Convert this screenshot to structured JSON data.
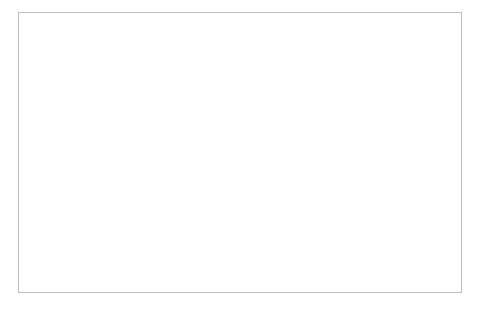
{
  "chart_data": {
    "type": "line",
    "title": "",
    "xlabel": "Number of Requests",
    "ylabel": "Execution Time (sec)",
    "xlim": [
      0,
      50
    ],
    "ylim": [
      0,
      3.5
    ],
    "ytick_values": [
      0,
      0.5,
      1,
      1.5,
      2,
      2.5,
      3,
      3.5
    ],
    "ytick_labels": [
      "0",
      "0.5",
      "1",
      "1.5",
      "2",
      "2.5",
      "3",
      "3.5"
    ],
    "xtick_values": [
      0,
      10,
      20,
      30,
      40,
      50
    ],
    "xtick_labels": [
      "0",
      "10",
      "20",
      "30",
      "40",
      "50"
    ],
    "grid": "horizontal",
    "legend_position": "bottom",
    "x": [
      1,
      2,
      3,
      4,
      5,
      6,
      7,
      8,
      9,
      10,
      11,
      12,
      13,
      14,
      15,
      16,
      17,
      18,
      19,
      20,
      21,
      22,
      23,
      24,
      25,
      26,
      27,
      28,
      29,
      30,
      31,
      32,
      33,
      34,
      35,
      36,
      37,
      38,
      39,
      40,
      41,
      42,
      43,
      44,
      45,
      46,
      47,
      48,
      49,
      50
    ],
    "series": [
      {
        "name": "Best Case",
        "color": "#a6a6a6",
        "width": 2.0,
        "values": [
          0.68,
          0.62,
          0.42,
          0.3,
          0.26,
          0.24,
          0.2,
          0.32,
          0.42,
          0.36,
          0.3,
          0.24,
          0.3,
          0.4,
          0.36,
          0.29,
          0.34,
          0.27,
          0.24,
          0.33,
          0.3,
          0.24,
          0.31,
          0.38,
          0.32,
          0.27,
          0.34,
          0.41,
          0.36,
          0.28,
          0.22,
          0.27,
          0.38,
          0.33,
          0.25,
          0.31,
          0.4,
          0.35,
          0.27,
          0.22,
          0.27,
          0.36,
          0.3,
          0.24,
          0.3,
          0.36,
          0.28,
          0.23,
          0.22,
          0.22
        ]
      },
      {
        "name": "Reactive Case",
        "color": "#2b2b2b",
        "width": 2.2,
        "values": [
          0.7,
          3.3,
          0.58,
          0.5,
          0.62,
          0.58,
          0.47,
          0.52,
          0.64,
          0.62,
          0.6,
          0.66,
          0.72,
          0.66,
          0.6,
          0.68,
          0.62,
          0.58,
          0.7,
          0.62,
          0.56,
          0.6,
          0.66,
          0.62,
          0.56,
          0.62,
          0.68,
          0.64,
          0.6,
          0.66,
          0.7,
          0.64,
          0.58,
          0.62,
          0.68,
          0.63,
          0.58,
          0.62,
          0.66,
          0.6,
          0.56,
          0.62,
          0.67,
          0.62,
          0.55,
          0.5,
          0.56,
          0.66,
          0.58,
          0.6
        ]
      },
      {
        "name": "Proactive Case",
        "color": "#7f7f7f",
        "width": 2.0,
        "values": [
          0.66,
          0.55,
          0.5,
          0.48,
          0.47,
          0.46,
          0.46,
          0.48,
          0.5,
          0.49,
          0.47,
          0.46,
          0.48,
          0.5,
          0.49,
          0.47,
          0.46,
          0.45,
          0.47,
          0.5,
          0.49,
          0.46,
          0.45,
          0.47,
          0.49,
          0.48,
          0.46,
          0.47,
          0.5,
          0.49,
          0.47,
          0.46,
          0.48,
          0.5,
          0.48,
          0.46,
          0.47,
          0.49,
          0.5,
          0.48,
          0.46,
          0.47,
          0.49,
          0.5,
          0.48,
          0.47,
          0.49,
          0.52,
          0.56,
          0.54
        ]
      }
    ]
  },
  "legend": {
    "entries": [
      {
        "label": "Best Case"
      },
      {
        "label": "Reactive Case"
      },
      {
        "label": "Proactive Case"
      }
    ]
  }
}
